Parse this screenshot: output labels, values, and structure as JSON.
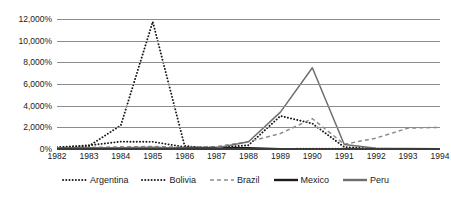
{
  "chart_data": {
    "type": "line",
    "title": "",
    "subtitle": "",
    "xlabel": "",
    "ylabel": "",
    "x": [
      1982,
      1983,
      1984,
      1985,
      1986,
      1987,
      1988,
      1989,
      1990,
      1991,
      1992,
      1993,
      1994
    ],
    "categories": [
      "1982",
      "1983",
      "1984",
      "1985",
      "1986",
      "1987",
      "1988",
      "1989",
      "1990",
      "1991",
      "1992",
      "1993",
      "1994"
    ],
    "ylim": [
      0,
      12000
    ],
    "ytick_values": [
      0,
      2000,
      4000,
      6000,
      8000,
      10000,
      12000
    ],
    "ytick_labels": [
      "0%",
      "2,000%",
      "4,000%",
      "6,000%",
      "8,000%",
      "10,000%",
      "12,000%"
    ],
    "xtick_labels": [
      "1982",
      "1983",
      "1984",
      "1985",
      "1986",
      "1987",
      "1988",
      "1989",
      "1990",
      "1991",
      "1992",
      "1993",
      "1994"
    ],
    "grid": true,
    "legend_position": "bottom",
    "series": [
      {
        "name": "Argentina",
        "style": "dotted",
        "color": "#1a1a1a",
        "values": [
          160,
          340,
          680,
          660,
          180,
          130,
          350,
          3050,
          2350,
          180,
          20,
          10,
          5
        ]
      },
      {
        "name": "Bolivia",
        "style": "dotted",
        "color": "#1a1a1a",
        "values": [
          120,
          280,
          2180,
          11750,
          280,
          15,
          15,
          15,
          18,
          20,
          12,
          9,
          8
        ]
      },
      {
        "name": "Brazil",
        "style": "dashed",
        "color": "#8c8c8c",
        "values": [
          100,
          140,
          200,
          230,
          150,
          220,
          680,
          1430,
          2800,
          440,
          1010,
          1930,
          2000
        ]
      },
      {
        "name": "Mexico",
        "style": "solid",
        "color": "#1a1a1a",
        "values": [
          60,
          100,
          65,
          58,
          86,
          132,
          114,
          20,
          27,
          23,
          16,
          10,
          7
        ]
      },
      {
        "name": "Peru",
        "style": "solid",
        "color": "#6e6e6e",
        "values": [
          65,
          110,
          110,
          160,
          78,
          86,
          670,
          3400,
          7500,
          410,
          74,
          49,
          24
        ]
      }
    ]
  }
}
